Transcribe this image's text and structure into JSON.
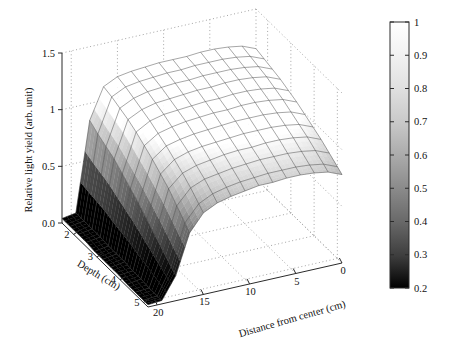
{
  "figure": {
    "background": "#ffffff",
    "title": ""
  },
  "axes": {
    "z": {
      "label": "Relative light yield (arb. unit)",
      "ticks": [
        "0.0",
        "0.5",
        "1",
        "1.5"
      ],
      "values": [
        0.0,
        0.5,
        1.0,
        1.5
      ],
      "min": 0.0,
      "max": 1.5
    },
    "depth": {
      "label": "Depth (cm)",
      "ticks": [
        "2",
        "3",
        "4",
        "5"
      ],
      "values": [
        2,
        3,
        4,
        5
      ],
      "min": 1.5,
      "max": 5.2
    },
    "distance": {
      "label": "Distance from center (cm)",
      "ticks": [
        "20",
        "15",
        "10",
        "5",
        "0"
      ],
      "values": [
        20,
        15,
        10,
        5,
        0
      ],
      "min": 0,
      "max": 21,
      "reversed": true
    }
  },
  "colorbar": {
    "ticks": [
      "1",
      "0.9",
      "0.8",
      "0.7",
      "0.6",
      "0.5",
      "0.4",
      "0.3",
      "0.2"
    ],
    "values": [
      1,
      0.9,
      0.8,
      0.7,
      0.6,
      0.5,
      0.4,
      0.3,
      0.2
    ],
    "min": 0.2,
    "max": 1.0,
    "colormap": "gray",
    "low_color": "#000000",
    "high_color": "#ffffff",
    "orientation": "vertical"
  },
  "chart_data": {
    "type": "surface",
    "title": "",
    "xlabel": "Distance from center (cm)",
    "ylabel": "Depth (cm)",
    "zlabel": "Relative light yield (arb. unit)",
    "colorbar_label": "",
    "grid": true,
    "legend": null,
    "xlim": [
      21,
      0
    ],
    "ylim": [
      1.5,
      5.2
    ],
    "zlim": [
      0.0,
      1.5
    ],
    "clim": [
      0.2,
      1.0
    ],
    "x": [
      21,
      19.5,
      18,
      16.5,
      15,
      13.5,
      12,
      10.5,
      9,
      7.5,
      6,
      4.5,
      3,
      1.5,
      0
    ],
    "y": [
      1.5,
      1.85,
      2.2,
      2.55,
      2.9,
      3.25,
      3.6,
      3.95,
      4.3,
      4.65,
      5.0,
      5.2
    ],
    "z": [
      [
        0.04,
        0.06,
        0.85,
        1.12,
        1.18,
        1.2,
        1.21,
        1.22,
        1.22,
        1.22,
        1.23,
        1.23,
        1.22,
        1.2,
        1.15
      ],
      [
        0.04,
        0.06,
        0.8,
        1.1,
        1.16,
        1.18,
        1.19,
        1.2,
        1.2,
        1.21,
        1.21,
        1.21,
        1.2,
        1.18,
        1.13
      ],
      [
        0.04,
        0.06,
        0.76,
        1.07,
        1.13,
        1.16,
        1.17,
        1.18,
        1.18,
        1.19,
        1.19,
        1.19,
        1.18,
        1.16,
        1.11
      ],
      [
        0.04,
        0.06,
        0.72,
        1.04,
        1.1,
        1.13,
        1.14,
        1.15,
        1.16,
        1.16,
        1.17,
        1.17,
        1.16,
        1.14,
        1.09
      ],
      [
        0.03,
        0.05,
        0.66,
        1.0,
        1.07,
        1.1,
        1.11,
        1.12,
        1.13,
        1.13,
        1.14,
        1.14,
        1.13,
        1.11,
        1.06
      ],
      [
        0.03,
        0.05,
        0.6,
        0.95,
        1.03,
        1.06,
        1.08,
        1.09,
        1.1,
        1.1,
        1.11,
        1.11,
        1.1,
        1.08,
        1.03
      ],
      [
        0.03,
        0.05,
        0.54,
        0.9,
        0.99,
        1.02,
        1.04,
        1.05,
        1.06,
        1.07,
        1.07,
        1.07,
        1.06,
        1.04,
        0.99
      ],
      [
        0.03,
        0.04,
        0.47,
        0.84,
        0.94,
        0.98,
        1.0,
        1.01,
        1.02,
        1.03,
        1.03,
        1.03,
        1.02,
        1.0,
        0.95
      ],
      [
        0.02,
        0.04,
        0.4,
        0.78,
        0.89,
        0.93,
        0.95,
        0.97,
        0.98,
        0.98,
        0.99,
        0.99,
        0.98,
        0.96,
        0.91
      ],
      [
        0.02,
        0.03,
        0.33,
        0.7,
        0.83,
        0.88,
        0.9,
        0.92,
        0.93,
        0.94,
        0.94,
        0.94,
        0.93,
        0.91,
        0.86
      ],
      [
        0.02,
        0.03,
        0.26,
        0.62,
        0.76,
        0.82,
        0.85,
        0.87,
        0.88,
        0.89,
        0.89,
        0.89,
        0.88,
        0.86,
        0.81
      ],
      [
        0.02,
        0.03,
        0.22,
        0.57,
        0.72,
        0.78,
        0.81,
        0.83,
        0.85,
        0.85,
        0.86,
        0.86,
        0.85,
        0.83,
        0.78
      ]
    ]
  }
}
